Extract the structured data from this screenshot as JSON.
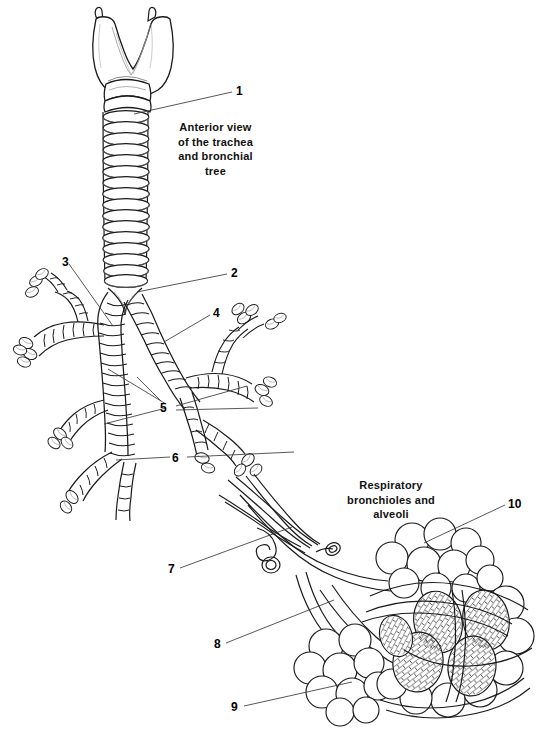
{
  "figure": {
    "title_visible": false,
    "background_color": "#ffffff",
    "ink_color": "#1a1a1a",
    "width": 551,
    "height": 738,
    "style": "black-and-white line drawing, anatomical illustration"
  },
  "captions": {
    "trachea": "Anterior view\nof the trachea\nand bronchial\ntree",
    "alveoli": "Respiratory\nbronchioles and\nalveoli"
  },
  "labels": [
    {
      "id": "1",
      "text": "1",
      "x": 236,
      "y": 85,
      "target_x": 134,
      "target_y": 114
    },
    {
      "id": "2",
      "text": "2",
      "x": 231,
      "y": 267,
      "target_x": 136,
      "target_y": 291
    },
    {
      "id": "3",
      "text": "3",
      "x": 62,
      "y": 256,
      "target_x": 112,
      "target_y": 325
    },
    {
      "id": "4",
      "text": "4",
      "x": 213,
      "y": 307,
      "target_x": 164,
      "target_y": 341
    },
    {
      "id": "5",
      "text": "5",
      "x": 160,
      "y": 402,
      "target_x": 108,
      "target_y": 371
    },
    {
      "id": "6",
      "text": "6",
      "x": 172,
      "y": 452,
      "target_x": 115,
      "target_y": 459
    },
    {
      "id": "7",
      "text": "7",
      "x": 168,
      "y": 563,
      "target_x": 290,
      "target_y": 528
    },
    {
      "id": "8",
      "text": "8",
      "x": 214,
      "y": 638,
      "target_x": 332,
      "target_y": 600
    },
    {
      "id": "9",
      "text": "9",
      "x": 231,
      "y": 701,
      "target_x": 350,
      "target_y": 682
    },
    {
      "id": "10",
      "text": "10",
      "x": 508,
      "y": 498,
      "target_x": 424,
      "target_y": 541
    }
  ],
  "leaders": {
    "5_lines": [
      {
        "from_x": 166,
        "from_y": 404,
        "to_x": 108,
        "to_y": 369
      },
      {
        "from_x": 166,
        "from_y": 408,
        "to_x": 104,
        "to_y": 424
      },
      {
        "from_x": 160,
        "from_y": 400,
        "to_x": 137,
        "to_y": 377
      },
      {
        "from_x": 176,
        "from_y": 406,
        "to_x": 247,
        "to_y": 386
      },
      {
        "from_x": 176,
        "from_y": 410,
        "to_x": 258,
        "to_y": 408
      }
    ],
    "6_lines": [
      {
        "from_x": 170,
        "from_y": 456,
        "to_x": 115,
        "to_y": 459
      },
      {
        "from_x": 186,
        "from_y": 456,
        "to_x": 293,
        "to_y": 452
      }
    ]
  },
  "structures": {
    "upper_figure": [
      "larynx-thyroid-cartilage",
      "cricoid-cartilage",
      "trachea-cartilage-rings",
      "carina",
      "right-main-bronchus",
      "left-main-bronchus",
      "lobar-bronchi",
      "segmental-bronchi"
    ],
    "lower_figure": [
      "pulmonary-arteriole",
      "pulmonary-venule",
      "respiratory-bronchiole",
      "alveolar-duct",
      "alveolar-sac-cluster",
      "capillary-network",
      "alveoli"
    ]
  },
  "counts": {
    "trachea_rings": 16,
    "numbered_labels": 10
  }
}
